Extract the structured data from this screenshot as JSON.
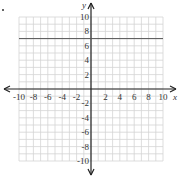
{
  "chart_data": {
    "type": "line",
    "title": "",
    "xlabel": "x",
    "ylabel": "y",
    "xlim": [
      -10,
      10
    ],
    "ylim": [
      -10,
      10
    ],
    "grid": true,
    "x_ticks": [
      -10,
      -8,
      -6,
      -4,
      -2,
      2,
      4,
      6,
      8,
      10
    ],
    "y_ticks": [
      10,
      8,
      6,
      4,
      2,
      -2,
      -4,
      -6,
      -8,
      -10
    ],
    "series": [
      {
        "name": "y = 7",
        "x": [
          -10,
          10
        ],
        "values": [
          7,
          7
        ]
      }
    ],
    "marker": "•"
  }
}
